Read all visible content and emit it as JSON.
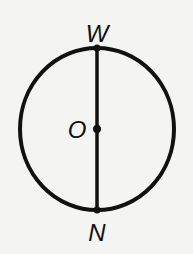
{
  "diagram": {
    "type": "circle-with-diameter",
    "labels": {
      "top": "W",
      "center": "O",
      "bottom": "N"
    },
    "colors": {
      "stroke": "#111111",
      "background": "#f4f4f2"
    }
  }
}
